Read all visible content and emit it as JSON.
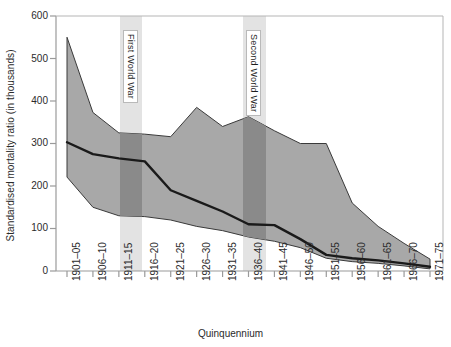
{
  "chart": {
    "type": "area",
    "title": "",
    "xlabel": "Quinquennium",
    "ylabel": "Standardised mortality ratio (in thousands)",
    "ylim": [
      0,
      600
    ],
    "ytick_labels": [
      "600",
      "500",
      "400",
      "300",
      "200",
      "100",
      "0"
    ],
    "ytick_values": [
      600,
      500,
      400,
      300,
      200,
      100,
      0
    ],
    "grid": false,
    "legend_position": "none",
    "annotations": [
      {
        "label": "First World War",
        "start_category": "1911–15",
        "end_category": "1916–20"
      },
      {
        "label": "Second World War",
        "start_category": "1936–40",
        "end_category": "1941–45"
      }
    ]
  },
  "chart_data": {
    "type": "area",
    "title": "",
    "xlabel": "Quinquennium",
    "ylabel": "Standardised mortality ratio (in thousands)",
    "ylim": [
      0,
      600
    ],
    "grid": false,
    "legend_position": "none",
    "categories": [
      "1901–05",
      "1906–10",
      "1911–15",
      "1916–20",
      "1921–25",
      "1926–30",
      "1931–35",
      "1936–40",
      "1941–45",
      "1946–50",
      "1951–55",
      "1956–60",
      "1961–65",
      "1966–70",
      "1971–75"
    ],
    "series": [
      {
        "name": "Upper bound",
        "values": [
          550,
          373,
          325,
          322,
          316,
          385,
          340,
          363,
          330,
          300,
          300,
          160,
          105,
          65,
          28
        ]
      },
      {
        "name": "Median",
        "values": [
          303,
          275,
          265,
          258,
          190,
          165,
          140,
          110,
          108,
          75,
          38,
          30,
          25,
          18,
          10
        ]
      },
      {
        "name": "Lower bound",
        "values": [
          221,
          150,
          130,
          128,
          120,
          105,
          95,
          80,
          70,
          55,
          30,
          22,
          18,
          12,
          5
        ]
      }
    ],
    "annotations": [
      {
        "text": "First World War",
        "x_start": "1911–15",
        "x_end": "1916–20"
      },
      {
        "text": "Second World War",
        "x_start": "1936–40",
        "x_end": "1941–45"
      }
    ],
    "colors": {
      "band_fill": "#a8a8a8",
      "war_band": "#e0e0e0",
      "war_overlap": "#8a8a8a",
      "median_line": "#1a1a1a",
      "axis": "#9a9a9a",
      "text": "#2b2b2b"
    }
  }
}
